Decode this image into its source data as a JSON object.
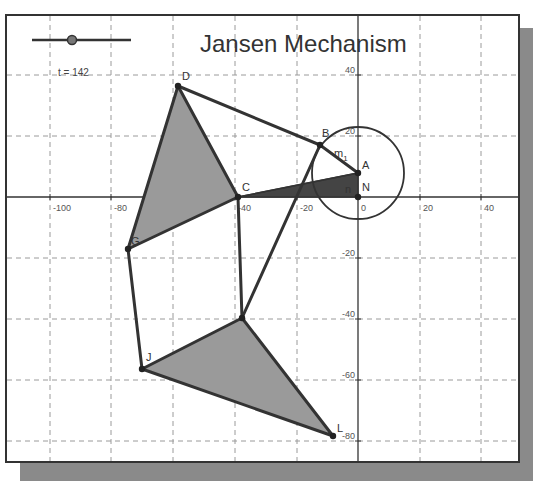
{
  "title": "Jansen Mechanism",
  "slider": {
    "label": "t = 142",
    "value": 142
  },
  "axes": {
    "x_ticks": [
      {
        "label": "-100",
        "px": 50
      },
      {
        "label": "-80",
        "px": 111
      },
      {
        "label": "-60",
        "px": 173
      },
      {
        "label": "-40",
        "px": 235
      },
      {
        "label": "-20",
        "px": 297
      },
      {
        "label": "0",
        "px": 358
      },
      {
        "label": "20",
        "px": 420
      },
      {
        "label": "40",
        "px": 481
      }
    ],
    "y_ticks": [
      {
        "label": "40",
        "px": 75
      },
      {
        "label": "20",
        "px": 136
      },
      {
        "label": "-20",
        "px": 258
      },
      {
        "label": "-40",
        "px": 319
      },
      {
        "label": "-60",
        "px": 380
      },
      {
        "label": "-80",
        "px": 441
      }
    ]
  },
  "points": {
    "A": {
      "label": "A",
      "x": 358,
      "y": 173
    },
    "N": {
      "label": "N",
      "x": 358,
      "y": 197
    },
    "B": {
      "label": "B",
      "x": 320,
      "y": 145
    },
    "C": {
      "label": "C",
      "x": 238,
      "y": 197
    },
    "D": {
      "label": "D",
      "x": 178,
      "y": 86
    },
    "G": {
      "label": "G",
      "x": 128,
      "y": 249
    },
    "H": {
      "label": "",
      "x": 242,
      "y": 318
    },
    "J": {
      "label": "J",
      "x": 142,
      "y": 369
    },
    "L": {
      "label": "L",
      "x": 333,
      "y": 436
    }
  },
  "crank_label": "m",
  "crank_subscript": "1",
  "small_label": "n",
  "colors": {
    "line": "#333333",
    "fill_light": "#9a9a9a",
    "fill_dark": "#444444",
    "grid": "#9a9a9a",
    "shadow": "#8a8a8a"
  }
}
